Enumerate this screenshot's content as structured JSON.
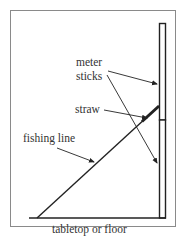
{
  "diagram": {
    "labels": {
      "meter": "meter",
      "sticks": "sticks",
      "straw": "straw",
      "fishing_line": "fishing line",
      "floor": "tabletop or floor"
    },
    "colors": {
      "frame": "#8a8a8a",
      "line": "#222222",
      "text": "#333333",
      "background": "#ffffff"
    }
  }
}
